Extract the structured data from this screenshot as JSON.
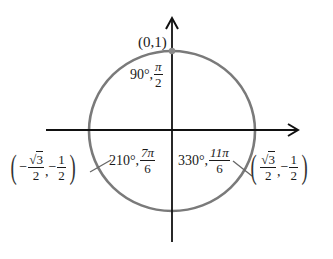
{
  "diagram": {
    "type": "unit-circle",
    "colors": {
      "axis": "#111111",
      "circle": "#7a7a7a",
      "point": "#8a8a8a",
      "leader": "#666666"
    },
    "axes": {
      "x_axis": {
        "from": [
          46,
          130
        ],
        "to": [
          299,
          130
        ],
        "arrow": true
      },
      "y_axis": {
        "from": [
          172,
          242
        ],
        "to": [
          172,
          18
        ],
        "arrow": true
      }
    },
    "circle": {
      "cx": 172,
      "cy": 131,
      "rx": 83,
      "ry": 80
    },
    "points": [
      {
        "id": "p90",
        "coord_label": "(0,1)",
        "angle_deg": "90°",
        "angle_rad_num": "π",
        "angle_rad_den": "2"
      },
      {
        "id": "p210",
        "angle_deg": "210°",
        "angle_rad_num": "7π",
        "angle_rad_den": "6",
        "coord": {
          "x_sign": "−",
          "x_num_radicand": "3",
          "x_den": "2",
          "sep": ",",
          "y_sign": "−",
          "y_num": "1",
          "y_den": "2"
        }
      },
      {
        "id": "p330",
        "angle_deg": "330°",
        "angle_rad_num": "11π",
        "angle_rad_den": "6",
        "coord": {
          "x_num_radicand": "3",
          "x_den": "2",
          "sep": ",",
          "y_sign": "−",
          "y_num": "1",
          "y_den": "2"
        }
      }
    ],
    "symbols": {
      "open_paren": "(",
      "close_paren": ")",
      "sqrt": "√",
      "comma": ","
    }
  }
}
